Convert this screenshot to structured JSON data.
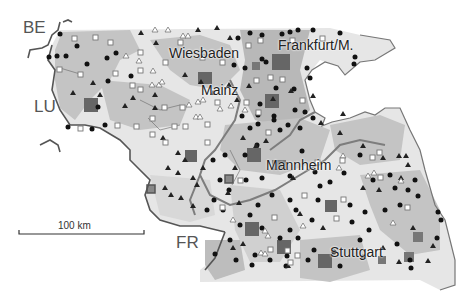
{
  "map": {
    "colors": {
      "background": "#ffffff",
      "region_light": "#e6e6e6",
      "region_mid": "#c4c4c4",
      "region_dark": "#a8a8a8",
      "border": "#555555",
      "state_border": "#7a7a7a",
      "symbol_dark": "#111111",
      "square_fill": "#666666",
      "square_outline": "#777777"
    },
    "countries": [
      {
        "code": "BE",
        "label": "BE"
      },
      {
        "code": "LU",
        "label": "LU"
      },
      {
        "code": "FR",
        "label": "FR"
      }
    ],
    "cities": [
      {
        "name": "Wiesbaden",
        "label": "Wiesbaden"
      },
      {
        "name": "Frankfurt/M.",
        "label": "Frankfurt/M."
      },
      {
        "name": "Mainz",
        "label": "Mainz"
      },
      {
        "name": "Mannheim",
        "label": "Mannheim"
      },
      {
        "name": "Stuttgart",
        "label": "Stuttgart"
      }
    ],
    "scale_bar": {
      "label": "100 km"
    },
    "symbols": [
      "filled-circle",
      "filled-triangle",
      "open-triangle",
      "open-square",
      "large-filled-square",
      "square-with-outline"
    ]
  }
}
